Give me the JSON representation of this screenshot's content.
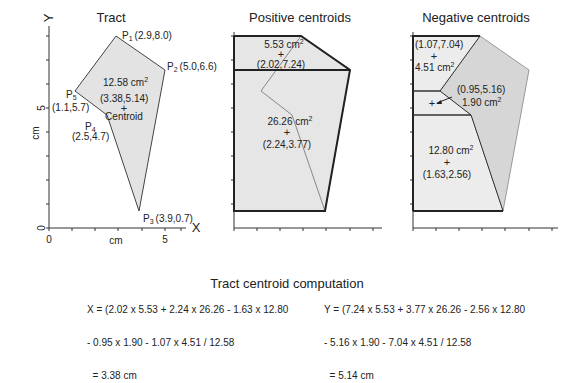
{
  "panels": {
    "tract": {
      "title": "Tract",
      "x_axis_letter": "X",
      "y_axis_letter": "Y",
      "x_unit": "cm",
      "y_unit": "cm",
      "x_ticks": [
        "0",
        "5"
      ],
      "y_ticks": [
        "0",
        "5"
      ],
      "points": [
        {
          "label": "P",
          "sub": "1",
          "coord": "(2.9,8.0)"
        },
        {
          "label": "P",
          "sub": "2",
          "coord": "(5.0,6.6)"
        },
        {
          "label": "P",
          "sub": "3",
          "coord": "(3.9,0.7)"
        },
        {
          "label": "P",
          "sub": "4",
          "coord": "(2.5,4.7)"
        },
        {
          "label": "P",
          "sub": "5",
          "coord": "(1.1,5.7)"
        }
      ],
      "area": "12.58 cm",
      "area_sup": "2",
      "centroid_coord": "(3.38,5.14)",
      "centroid_marker": "+",
      "centroid_label": "Centroid"
    },
    "positive": {
      "title": "Positive centroids",
      "regions": [
        {
          "area": "5.53 cm",
          "sup": "2",
          "marker": "+",
          "coord": "(2.02,7.24)"
        },
        {
          "area": "26.26 cm",
          "sup": "2",
          "marker": "+",
          "coord": "(2.24,3.77)"
        }
      ]
    },
    "negative": {
      "title": "Negative centroids",
      "regions": [
        {
          "coord": "(1.07,7.04)",
          "marker": "+",
          "area": "4.51 cm",
          "sup": "2"
        },
        {
          "coord": "(0.95,5.16)",
          "marker": "+",
          "area": "1.90 cm",
          "sup": "2"
        },
        {
          "area": "12.80 cm",
          "sup": "2",
          "marker": "+",
          "coord": "(1.63,2.56)"
        }
      ]
    }
  },
  "computation": {
    "title": "Tract centroid computation",
    "x_formula": [
      "X = (2.02 x 5.53 + 2.24 x 26.26 - 1.63 x 12.80",
      "- 0.95 x 1.90 - 1.07 x 4.51 / 12.58",
      "  = 3.38 cm"
    ],
    "y_formula": [
      "Y = (7.24 x 5.53 + 3.77 x 26.26 - 2.56 x 12.80",
      "- 5.16 x 1.90 - 7.04 x 4.51 / 12.58",
      "  = 5.14 cm"
    ]
  },
  "colors": {
    "fill_light": "#e6e6e6",
    "fill_mid": "#d9d9d9",
    "outline": "#222222",
    "thin_line": "#888888"
  }
}
